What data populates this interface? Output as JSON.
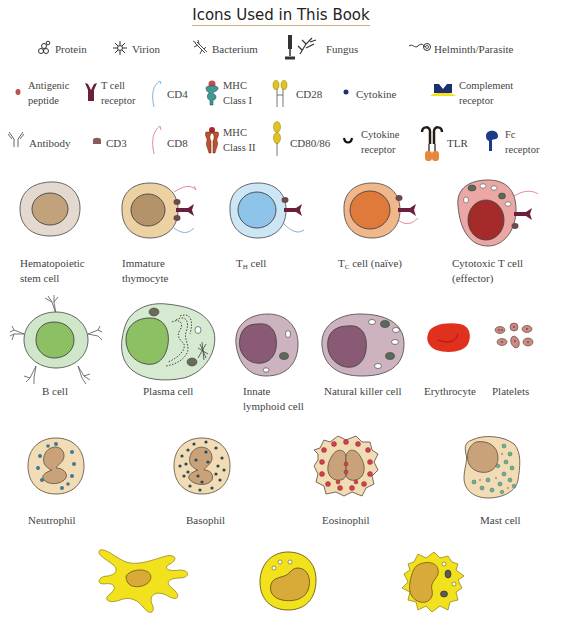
{
  "title": "Icons Used in This Book",
  "legend": {
    "row1": [
      {
        "icon": "protein-icon",
        "label": "Protein"
      },
      {
        "icon": "virion-icon",
        "label": "Virion"
      },
      {
        "icon": "bacterium-icon",
        "label": "Bacterium"
      },
      {
        "icon": "fungus-icon",
        "label": "Fungus"
      },
      {
        "icon": "helminth-icon",
        "label": "Helminth/Parasite"
      }
    ],
    "row2": [
      {
        "icon": "antigenic-peptide-icon",
        "label_a": "Antigenic",
        "label_b": "peptide",
        "color": "#c0504d"
      },
      {
        "icon": "t-cell-receptor-icon",
        "label_a": "T cell",
        "label_b": "receptor",
        "color": "#6b1f3a"
      },
      {
        "icon": "cd4-icon",
        "label": "CD4",
        "color": "#7fb3d9"
      },
      {
        "icon": "mhc-class-1-icon",
        "label_a": "MHC",
        "label_b": "Class I",
        "color": "#3f9a92"
      },
      {
        "icon": "cd28-icon",
        "label": "CD28",
        "color": "#e2c21f"
      },
      {
        "icon": "cytokine-icon",
        "label": "Cytokine",
        "color": "#1e2f6e"
      },
      {
        "icon": "complement-receptor-icon",
        "label_a": "Complement",
        "label_b": "receptor",
        "color": "#1e2f6e"
      }
    ],
    "row3": [
      {
        "icon": "antibody-icon",
        "label": "Antibody"
      },
      {
        "icon": "cd3-icon",
        "label": "CD3",
        "color": "#8b5a5a"
      },
      {
        "icon": "cd8-icon",
        "label": "CD8",
        "color": "#e28a9a"
      },
      {
        "icon": "mhc-class-2-icon",
        "label_a": "MHC",
        "label_b": "Class II",
        "color": "#c0502e"
      },
      {
        "icon": "cd80-86-icon",
        "label": "CD80/86",
        "color": "#e2c21f"
      },
      {
        "icon": "cytokine-receptor-icon",
        "label_a": "Cytokine",
        "label_b": "receptor"
      },
      {
        "icon": "tlr-icon",
        "label": "TLR",
        "color": "#e08a3a"
      },
      {
        "icon": "fc-receptor-icon",
        "label_a": "Fc",
        "label_b": "receptor",
        "color": "#1e3a8a"
      }
    ]
  },
  "cells": {
    "row1": [
      {
        "name": "hematopoietic-stem-cell",
        "label_a": "Hematopoietic",
        "label_b": "stem cell",
        "cytoplasm": "#e3d9cf",
        "nucleus": "#c2a27a"
      },
      {
        "name": "immature-thymocyte",
        "label_a": "Immature",
        "label_b": "thymocyte",
        "cytoplasm": "#ecd2a2",
        "nucleus": "#b4936b"
      },
      {
        "name": "th-cell",
        "label_main": "T",
        "label_sub": "H",
        "label_rest": " cell",
        "cytoplasm": "#cde6f5",
        "nucleus": "#8fc4ea"
      },
      {
        "name": "tc-cell-naive",
        "label_main": "T",
        "label_sub": "C",
        "label_rest": " cell (naïve)",
        "cytoplasm": "#f0b88a",
        "nucleus": "#e07a3a"
      },
      {
        "name": "cytotoxic-t-cell",
        "label_a": "Cytotoxic T cell",
        "label_b": "(effector)",
        "cytoplasm": "#eaa7a3",
        "nucleus": "#a52a2a"
      }
    ],
    "row2": [
      {
        "name": "b-cell",
        "label": "B cell",
        "cytoplasm": "#cfe6c8",
        "nucleus": "#8cc063"
      },
      {
        "name": "plasma-cell",
        "label": "Plasma cell",
        "cytoplasm": "#d5ead0",
        "nucleus": "#8cc063"
      },
      {
        "name": "innate-lymphoid-cell",
        "label_a": "Innate",
        "label_b": "lymphoid cell",
        "cytoplasm": "#cdb3c0",
        "nucleus": "#8a5a74"
      },
      {
        "name": "natural-killer-cell",
        "label": "Natural killer cell",
        "cytoplasm": "#cdb3c0",
        "nucleus": "#8a5a74"
      },
      {
        "name": "erythrocyte",
        "label": "Erythrocyte",
        "color": "#e0301e"
      },
      {
        "name": "platelets",
        "label": "Platelets",
        "color": "#c98a80"
      }
    ],
    "row3": [
      {
        "name": "neutrophil",
        "label": "Neutrophil",
        "cytoplasm": "#f1dcb5",
        "nucleus": "#c9a27a",
        "granules": "#3a7a9a"
      },
      {
        "name": "basophil",
        "label": "Basophil",
        "cytoplasm": "#f1dcb5",
        "nucleus": "#c9a27a",
        "granules": "#2a4a5a"
      },
      {
        "name": "eosinophil",
        "label": "Eosinophil",
        "cytoplasm": "#f1dcb5",
        "nucleus": "#c9a27a",
        "granules": "#d2404a"
      },
      {
        "name": "mast-cell",
        "label": "Mast cell",
        "cytoplasm": "#f1dcb5",
        "nucleus": "#c9a27a",
        "granules": "#6ab59a"
      }
    ],
    "row4": [
      {
        "name": "dendritic-cell",
        "cytoplasm": "#f2e21e",
        "nucleus": "#d8aa3a"
      },
      {
        "name": "monocyte",
        "cytoplasm": "#f2e21e",
        "nucleus": "#d8aa3a"
      },
      {
        "name": "macrophage",
        "cytoplasm": "#f2e21e",
        "nucleus": "#d8aa3a"
      }
    ]
  }
}
